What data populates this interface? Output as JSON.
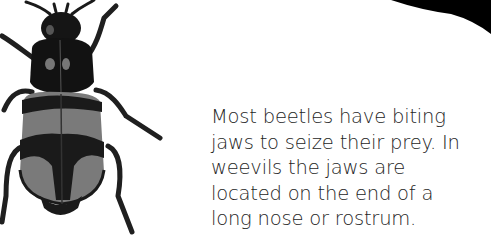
{
  "illustration": {
    "subject": "beetle",
    "palette": {
      "dark": "#141414",
      "mid": "#7a7a7a",
      "light": "#d8d8d8"
    }
  },
  "caption": {
    "lines": [
      "Most beetles have biting",
      "jaws to seize their prey. In",
      "weevils the jaws are",
      "located on the end of a",
      "long nose or rostrum."
    ]
  },
  "decoration": {
    "corner_color": "#000000"
  }
}
